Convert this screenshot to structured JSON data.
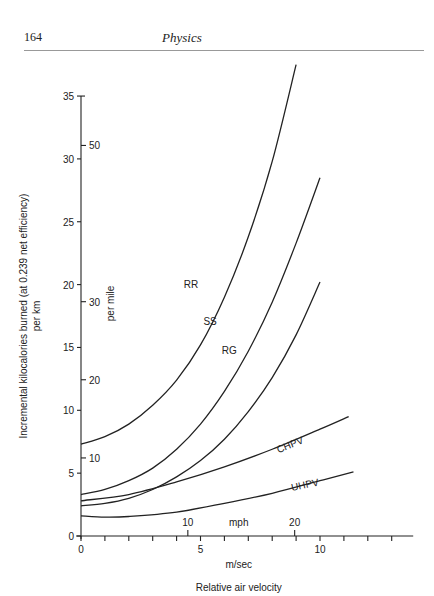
{
  "page": {
    "number": "164",
    "running_head": "Physics"
  },
  "chart_data": {
    "type": "line",
    "title": "",
    "xlabel": "Relative air velocity",
    "x_unit_primary": "m/sec",
    "x_unit_secondary": "mph",
    "ylabel": "Incremental kilocalories burned (at 0.239 net efficiency)",
    "ylabel_unit_primary": "per km",
    "ylabel_unit_secondary": "per mile",
    "xlim": [
      0,
      14
    ],
    "ylim": [
      0,
      35
    ],
    "x_ticks": [
      0,
      1,
      2,
      3,
      4,
      5,
      6,
      7,
      8,
      9,
      10,
      11,
      12,
      13
    ],
    "x_tick_labels": {
      "0": "0",
      "5": "5",
      "10": "10"
    },
    "mph_ticks": [
      {
        "label": "10",
        "ms": 4.47
      },
      {
        "label": "20",
        "ms": 8.94
      }
    ],
    "y_ticks": [
      0,
      5,
      10,
      15,
      20,
      25,
      30,
      35
    ],
    "per_mile_ticks": [
      {
        "label": "10",
        "km": 6.21
      },
      {
        "label": "20",
        "km": 12.43
      },
      {
        "label": "30",
        "km": 18.64
      },
      {
        "label": "50",
        "km": 31.07
      }
    ],
    "grid": false,
    "legend": "inline labels",
    "series": [
      {
        "name": "RR",
        "x": [
          0,
          1,
          2,
          3,
          4,
          5,
          6,
          7,
          8,
          9
        ],
        "values": [
          7.3,
          7.9,
          8.9,
          10.4,
          12.4,
          15.2,
          19.0,
          23.8,
          29.8,
          37.5
        ],
        "label_at": [
          4.6,
          19.7
        ]
      },
      {
        "name": "SS",
        "x": [
          0,
          1,
          2,
          3,
          4,
          5,
          6,
          7,
          8,
          9,
          10
        ],
        "values": [
          3.3,
          3.7,
          4.4,
          5.4,
          6.9,
          8.9,
          11.5,
          14.7,
          18.6,
          23.3,
          28.5
        ],
        "label_at": [
          5.4,
          16.8
        ]
      },
      {
        "name": "RG",
        "x": [
          0,
          1,
          2,
          3,
          4,
          5,
          6,
          7,
          8,
          9,
          10
        ],
        "values": [
          2.4,
          2.6,
          3.0,
          3.7,
          4.7,
          6.0,
          7.7,
          9.9,
          12.6,
          16.0,
          20.2
        ],
        "label_at": [
          6.2,
          14.5
        ]
      },
      {
        "name": "CHPV",
        "x": [
          0,
          2,
          4,
          6,
          8,
          10,
          11.2
        ],
        "values": [
          2.8,
          3.3,
          4.3,
          5.5,
          6.9,
          8.5,
          9.5
        ],
        "label_at": [
          8.8,
          7.0
        ]
      },
      {
        "name": "UHPV",
        "x": [
          0,
          1,
          2,
          4,
          6,
          8,
          10,
          11.4
        ],
        "values": [
          1.6,
          1.5,
          1.55,
          1.9,
          2.6,
          3.4,
          4.4,
          5.1
        ],
        "label_at": [
          9.4,
          3.8
        ]
      }
    ]
  }
}
